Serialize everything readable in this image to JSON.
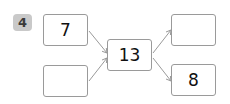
{
  "problem": {
    "number": "4",
    "inputs": [
      {
        "value": "7"
      },
      {
        "value": ""
      }
    ],
    "center": {
      "value": "13"
    },
    "outputs": [
      {
        "value": ""
      },
      {
        "value": "8"
      }
    ]
  },
  "colors": {
    "badge_bg": "#c9c9c9",
    "box_border": "#9a9a9a",
    "arrow": "#9a9a9a"
  }
}
